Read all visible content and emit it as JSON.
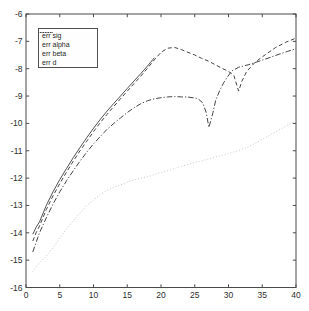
{
  "chart_data": {
    "type": "line",
    "title": "",
    "xlabel": "",
    "ylabel": "",
    "xlim": [
      0,
      40
    ],
    "ylim": [
      -16,
      -6
    ],
    "x_ticks": [
      0,
      5,
      10,
      15,
      20,
      25,
      30,
      35,
      40
    ],
    "y_ticks": [
      -16,
      -15,
      -14,
      -13,
      -12,
      -11,
      -10,
      -9,
      -8,
      -7,
      -6
    ],
    "grid": false,
    "box": true,
    "background_color": "#ffffff",
    "axis_color": "#4a4a4a",
    "tick_label_color": "#2e2e2e",
    "legend": {
      "position": "upper-left",
      "border": true
    },
    "series": [
      {
        "name": "err sig",
        "line_style": "solid",
        "color": "#3d3d3d",
        "points": [
          [
            1,
            -14.05
          ],
          [
            1.5,
            -13.8
          ],
          [
            2,
            -13.6
          ],
          [
            3,
            -13.0
          ],
          [
            4,
            -12.5
          ],
          [
            5,
            -12.05
          ],
          [
            6,
            -11.65
          ],
          [
            7,
            -11.25
          ],
          [
            8,
            -10.88
          ],
          [
            9,
            -10.52
          ],
          [
            10,
            -10.18
          ],
          [
            11,
            -9.85
          ],
          [
            12,
            -9.55
          ],
          [
            13,
            -9.27
          ],
          [
            14,
            -9.0
          ],
          [
            15,
            -8.72
          ],
          [
            16,
            -8.45
          ],
          [
            17,
            -8.18
          ],
          [
            18,
            -7.9
          ],
          [
            19,
            -7.6
          ]
        ]
      },
      {
        "name": "err alpha",
        "line_style": "dashed",
        "color": "#454545",
        "points": [
          [
            1,
            -14.3
          ],
          [
            1.5,
            -14.0
          ],
          [
            2,
            -13.75
          ],
          [
            3,
            -13.15
          ],
          [
            4,
            -12.65
          ],
          [
            5,
            -12.2
          ],
          [
            6,
            -11.78
          ],
          [
            7,
            -11.38
          ],
          [
            8,
            -11.0
          ],
          [
            9,
            -10.65
          ],
          [
            10,
            -10.3
          ],
          [
            11,
            -9.97
          ],
          [
            12,
            -9.67
          ],
          [
            13,
            -9.38
          ],
          [
            14,
            -9.1
          ],
          [
            15,
            -8.82
          ],
          [
            16,
            -8.55
          ],
          [
            17,
            -8.27
          ],
          [
            18,
            -7.98
          ],
          [
            19,
            -7.68
          ],
          [
            20,
            -7.4
          ],
          [
            21,
            -7.25
          ],
          [
            22,
            -7.22
          ],
          [
            23,
            -7.3
          ],
          [
            24,
            -7.4
          ],
          [
            25,
            -7.5
          ],
          [
            26,
            -7.62
          ],
          [
            27,
            -7.72
          ],
          [
            28,
            -7.85
          ],
          [
            29,
            -7.98
          ],
          [
            30,
            -8.1
          ],
          [
            30.8,
            -8.25
          ],
          [
            31.5,
            -8.82
          ],
          [
            32,
            -8.45
          ],
          [
            32.7,
            -8.1
          ],
          [
            34,
            -7.75
          ],
          [
            35.5,
            -7.48
          ],
          [
            37,
            -7.22
          ],
          [
            38.5,
            -7.03
          ],
          [
            40,
            -6.88
          ]
        ]
      },
      {
        "name": "err beta",
        "line_style": "dash-dot",
        "color": "#454545",
        "points": [
          [
            1,
            -14.7
          ],
          [
            1.5,
            -14.35
          ],
          [
            2,
            -14.0
          ],
          [
            3,
            -13.45
          ],
          [
            4,
            -12.95
          ],
          [
            5,
            -12.5
          ],
          [
            6,
            -12.1
          ],
          [
            7,
            -11.73
          ],
          [
            8,
            -11.38
          ],
          [
            9,
            -11.05
          ],
          [
            10,
            -10.75
          ],
          [
            11,
            -10.48
          ],
          [
            12,
            -10.22
          ],
          [
            13,
            -10.0
          ],
          [
            14,
            -9.8
          ],
          [
            15,
            -9.6
          ],
          [
            16,
            -9.43
          ],
          [
            17,
            -9.28
          ],
          [
            18,
            -9.17
          ],
          [
            19,
            -9.1
          ],
          [
            20,
            -9.06
          ],
          [
            21,
            -9.03
          ],
          [
            22,
            -9.02
          ],
          [
            23,
            -9.03
          ],
          [
            24,
            -9.04
          ],
          [
            25,
            -9.07
          ],
          [
            25.5,
            -9.1
          ],
          [
            26.2,
            -9.25
          ],
          [
            26.7,
            -9.6
          ],
          [
            27.1,
            -10.15
          ],
          [
            27.7,
            -9.6
          ],
          [
            28.1,
            -9.15
          ],
          [
            28.7,
            -8.8
          ],
          [
            29.3,
            -8.5
          ],
          [
            29.9,
            -8.28
          ],
          [
            30.5,
            -8.08
          ],
          [
            31.5,
            -7.95
          ],
          [
            33,
            -7.85
          ],
          [
            34.5,
            -7.73
          ],
          [
            36,
            -7.6
          ],
          [
            37.5,
            -7.47
          ],
          [
            38.7,
            -7.37
          ],
          [
            40,
            -7.27
          ]
        ]
      },
      {
        "name": "err d",
        "line_style": "dotted",
        "color": "#c5cbc5",
        "points": [
          [
            1,
            -15.42
          ],
          [
            2,
            -15.1
          ],
          [
            3,
            -14.85
          ],
          [
            4,
            -14.55
          ],
          [
            5,
            -14.2
          ],
          [
            6,
            -13.85
          ],
          [
            7,
            -13.55
          ],
          [
            8,
            -13.28
          ],
          [
            9,
            -13.0
          ],
          [
            10,
            -12.8
          ],
          [
            11,
            -12.6
          ],
          [
            12,
            -12.45
          ],
          [
            13,
            -12.33
          ],
          [
            14,
            -12.25
          ],
          [
            15,
            -12.15
          ],
          [
            16,
            -12.07
          ],
          [
            17,
            -12.0
          ],
          [
            18,
            -11.95
          ],
          [
            19,
            -11.87
          ],
          [
            20,
            -11.8
          ],
          [
            21,
            -11.73
          ],
          [
            22,
            -11.65
          ],
          [
            23,
            -11.57
          ],
          [
            24,
            -11.5
          ],
          [
            25,
            -11.43
          ],
          [
            26,
            -11.37
          ],
          [
            27,
            -11.3
          ],
          [
            28,
            -11.23
          ],
          [
            29,
            -11.17
          ],
          [
            30,
            -11.1
          ],
          [
            31,
            -11.03
          ],
          [
            32,
            -10.95
          ],
          [
            33,
            -10.85
          ],
          [
            34,
            -10.72
          ],
          [
            35,
            -10.58
          ],
          [
            36,
            -10.45
          ],
          [
            37,
            -10.3
          ],
          [
            38,
            -10.17
          ],
          [
            39,
            -10.03
          ],
          [
            40,
            -9.9
          ]
        ]
      }
    ]
  }
}
